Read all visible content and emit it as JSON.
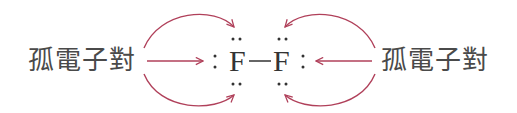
{
  "diagram": {
    "left_label": "孤電子對",
    "right_label": "孤電子對",
    "molecule": {
      "atoms": [
        {
          "symbol": "F",
          "lone_pairs": 3
        },
        {
          "symbol": "F",
          "lone_pairs": 3
        }
      ],
      "bond": "—",
      "bond_type": "single"
    },
    "arrow_count_per_side": 3,
    "colors": {
      "arrow": "#b0405a",
      "text": "#4a4a4a",
      "atom": "#333333",
      "dots": "#333333",
      "background": "#ffffff"
    }
  }
}
